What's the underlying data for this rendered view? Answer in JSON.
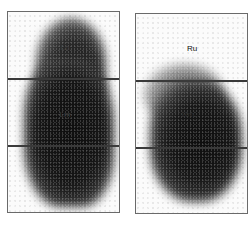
{
  "image": {
    "description": "Posterior lung perfusion scintigraphy split into left and right lung regions with upper, middle and lower zones",
    "panels": [
      {
        "side": "left",
        "zones": [
          {
            "id": "upper",
            "label": "Lu"
          },
          {
            "id": "middle",
            "label": "Lm"
          },
          {
            "id": "lower",
            "label": ""
          }
        ]
      },
      {
        "side": "right",
        "zones": [
          {
            "id": "upper",
            "label": "Ru"
          },
          {
            "id": "middle",
            "label": "Rm"
          },
          {
            "id": "lower",
            "label": ""
          }
        ]
      }
    ],
    "colors": {
      "frame": "#6a6a6a",
      "divider": "#3a3a3a",
      "uptake_dark": "#141414",
      "background": "#ffffff"
    }
  }
}
